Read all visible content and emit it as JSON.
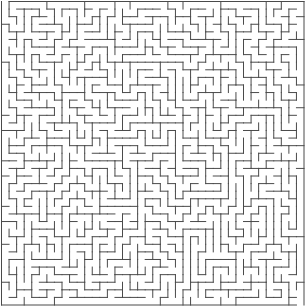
{
  "maze": {
    "title": "Maze",
    "columns": 40,
    "rows": 40,
    "entrance": "top-left",
    "exit": "bottom-right",
    "wall_color": "#4a4a4a",
    "background_color": "#ffffff",
    "seed": 12345
  }
}
